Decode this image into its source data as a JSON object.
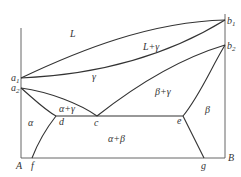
{
  "diagram": {
    "type": "binary phase diagram",
    "components": {
      "left": "A",
      "right": "B"
    },
    "points": {
      "a1": {
        "label": "a",
        "sub": "1",
        "x": 21,
        "y": 78
      },
      "a2": {
        "label": "a",
        "sub": "2",
        "x": 21,
        "y": 88
      },
      "b1": {
        "label": "b",
        "sub": "1",
        "x": 225,
        "y": 20
      },
      "b2": {
        "label": "b",
        "sub": "2",
        "x": 225,
        "y": 45
      },
      "c": {
        "label": "c",
        "x": 97,
        "y": 116
      },
      "d": {
        "label": "d",
        "x": 56,
        "y": 116
      },
      "e": {
        "label": "e",
        "x": 183,
        "y": 116
      },
      "f": {
        "label": "f",
        "x": 32,
        "y": 158
      },
      "g": {
        "label": "g",
        "x": 204,
        "y": 158
      }
    },
    "regions": [
      {
        "name": "L",
        "label": "L"
      },
      {
        "name": "L+gamma",
        "label": "L+γ"
      },
      {
        "name": "gamma",
        "label": "γ"
      },
      {
        "name": "beta+gamma",
        "label": "β+γ"
      },
      {
        "name": "alpha+gamma",
        "label": "α+γ"
      },
      {
        "name": "alpha",
        "label": "α"
      },
      {
        "name": "beta",
        "label": "β"
      },
      {
        "name": "alpha+beta",
        "label": "α+β"
      }
    ],
    "axis_labels": {
      "A": "A",
      "B": "B"
    }
  }
}
